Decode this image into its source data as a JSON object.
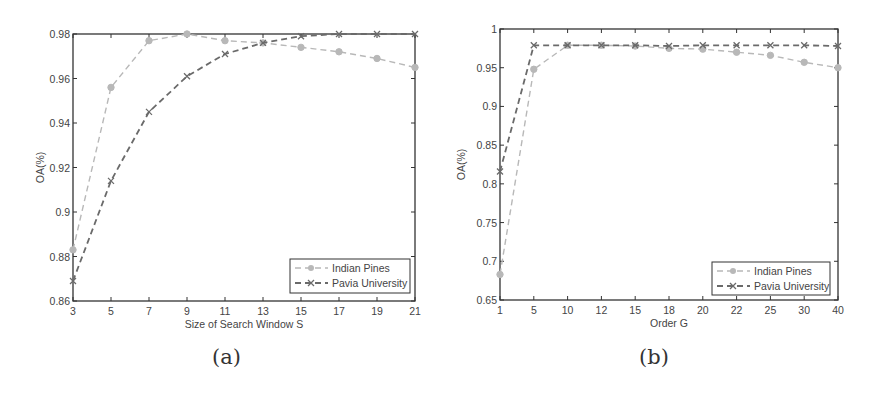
{
  "figures": [
    {
      "caption": "(a)",
      "legend": [
        "Indian Pines",
        "Pavia University"
      ]
    },
    {
      "caption": "(b)",
      "legend": [
        "Indian Pines",
        "Pavia University"
      ]
    }
  ],
  "colors": {
    "indian_pines": "#b8b8b8",
    "pavia_university": "#6a6a6a",
    "axis": "#333333"
  },
  "chart_data": [
    {
      "type": "line",
      "title": "",
      "xlabel": "Size of Search Window S",
      "ylabel": "OA(%)",
      "categories": [
        "3",
        "5",
        "7",
        "9",
        "11",
        "13",
        "15",
        "17",
        "19",
        "21"
      ],
      "x": [
        3,
        5,
        7,
        9,
        11,
        13,
        15,
        17,
        19,
        21
      ],
      "ylim": [
        0.86,
        0.98
      ],
      "yticks": [
        "0.86",
        "0.88",
        "0.9",
        "0.92",
        "0.94",
        "0.96",
        "0.98"
      ],
      "grid": false,
      "legend_position": "lower right",
      "series": [
        {
          "name": "Indian Pines",
          "marker": "circle",
          "linestyle": "dashed",
          "values": [
            0.883,
            0.956,
            0.977,
            0.98,
            0.977,
            0.976,
            0.974,
            0.972,
            0.969,
            0.965
          ]
        },
        {
          "name": "Pavia University",
          "marker": "x",
          "linestyle": "dashed",
          "values": [
            0.869,
            0.914,
            0.945,
            0.961,
            0.971,
            0.976,
            0.979,
            0.98,
            0.98,
            0.98
          ]
        }
      ]
    },
    {
      "type": "line",
      "title": "",
      "xlabel": "Order G",
      "ylabel": "OA(%)",
      "categories": [
        "1",
        "5",
        "10",
        "12",
        "15",
        "18",
        "20",
        "22",
        "25",
        "30",
        "40"
      ],
      "x": [
        1,
        5,
        10,
        12,
        15,
        18,
        20,
        22,
        25,
        30,
        40
      ],
      "ylim": [
        0.65,
        1.0
      ],
      "yticks": [
        "0.65",
        "0.7",
        "0.75",
        "0.8",
        "0.85",
        "0.9",
        "0.95",
        "1"
      ],
      "grid": false,
      "legend_position": "lower right",
      "series": [
        {
          "name": "Indian Pines",
          "marker": "circle",
          "linestyle": "dashed",
          "values": [
            0.683,
            0.948,
            0.979,
            0.979,
            0.978,
            0.975,
            0.974,
            0.97,
            0.966,
            0.957,
            0.95
          ]
        },
        {
          "name": "Pavia University",
          "marker": "x",
          "linestyle": "dashed",
          "values": [
            0.816,
            0.979,
            0.979,
            0.979,
            0.979,
            0.978,
            0.979,
            0.979,
            0.979,
            0.979,
            0.978
          ]
        }
      ]
    }
  ]
}
